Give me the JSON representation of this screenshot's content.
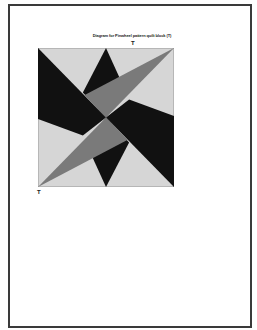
{
  "document": {
    "title": "Diagram for Pinwheel pattern quilt block (T)",
    "markers": {
      "top": "T",
      "bottom": "T"
    }
  },
  "figure": {
    "type": "quilt-block-diagram",
    "pattern": "pinwheel",
    "colors": {
      "background": "#d6d6d6",
      "dark": "#111111",
      "medium": "#7a7a7a",
      "outline": "#8a8a8a",
      "page_border": "#3a3a3a"
    },
    "pieces": [
      {
        "name": "dark-upper-left",
        "fill": "dark",
        "points": "0,0 50,50 33,63 0,51"
      },
      {
        "name": "dark-top",
        "fill": "dark",
        "points": "50,0 64,30 50,50 33,32"
      },
      {
        "name": "dark-right",
        "fill": "dark",
        "points": "100,100 50,50 67,37 100,49"
      },
      {
        "name": "dark-bottom",
        "fill": "dark",
        "points": "50,100 36,70 50,50 67,68"
      },
      {
        "name": "medium-upper-right",
        "fill": "medium",
        "points": "100,0 34,34 50,50"
      },
      {
        "name": "medium-lower-left",
        "fill": "medium",
        "points": "0,100 66,66 50,50"
      }
    ]
  }
}
